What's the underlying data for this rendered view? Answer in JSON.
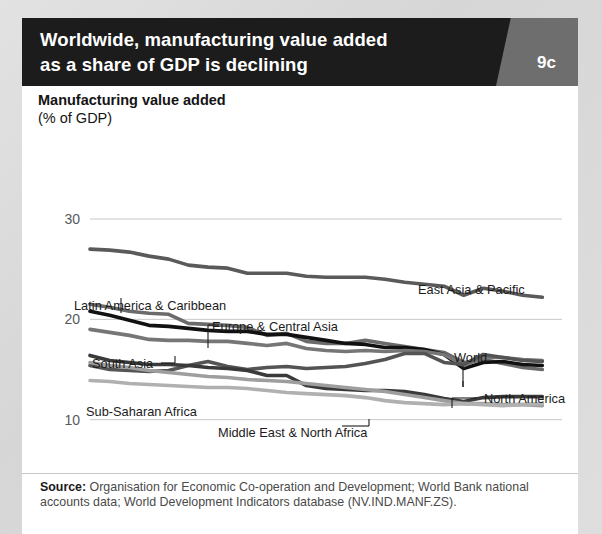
{
  "header": {
    "title": "Worldwide, manufacturing value added as a share of GDP is declining",
    "title_line1": "Worldwide, manufacturing value added",
    "title_line2": "as a share of GDP is declining",
    "badge": "9c",
    "badge_color": "#6e6e6e",
    "bar_color": "#1c1c1c"
  },
  "axis_title": {
    "line1": "Manufacturing value added",
    "line2": "(% of GDP)"
  },
  "source": {
    "label": "Source:",
    "text": " Organisation for Economic Co-operation and Development; World Bank national accounts data; World Development Indicators database (NV.IND.MANF.ZS)."
  },
  "chart_data": {
    "type": "line",
    "title": "Manufacturing value added (% of GDP)",
    "xlabel": "",
    "ylabel": "Manufacturing value added (% of GDP)",
    "xlim": [
      1990,
      2014
    ],
    "ylim": [
      0,
      30
    ],
    "yticks": [
      0,
      10,
      20,
      30
    ],
    "xticks": [
      1990,
      1995,
      2000,
      2005,
      2010,
      2014
    ],
    "grid": "horizontal",
    "legend": "inline-annotations",
    "x": [
      1990,
      1991,
      1992,
      1993,
      1994,
      1995,
      1996,
      1997,
      1998,
      1999,
      2000,
      2001,
      2002,
      2003,
      2004,
      2005,
      2006,
      2007,
      2008,
      2009,
      2010,
      2011,
      2012,
      2013
    ],
    "series": [
      {
        "name": "East Asia & Pacific",
        "color": "#5a5a5a",
        "label_x": 396,
        "label_y": 196,
        "values": [
          27.0,
          26.9,
          26.7,
          26.3,
          26.0,
          25.4,
          25.2,
          25.1,
          24.6,
          24.6,
          24.6,
          24.3,
          24.2,
          24.2,
          24.2,
          24.0,
          23.7,
          23.5,
          23.3,
          22.4,
          23.1,
          22.8,
          22.4,
          22.2
        ]
      },
      {
        "name": "Latin America & Caribbean",
        "color": "#6b6b6b",
        "label_x": 52,
        "label_y": 212,
        "values": [
          21.5,
          21.2,
          20.8,
          20.6,
          20.5,
          19.6,
          19.5,
          19.4,
          19.2,
          18.4,
          18.6,
          17.8,
          17.6,
          17.6,
          17.9,
          17.6,
          17.3,
          17.0,
          16.7,
          15.7,
          16.0,
          15.6,
          15.2,
          15.0
        ]
      },
      {
        "name": "Europe & Central Asia",
        "color": "#111111",
        "label_x": 190,
        "label_y": 233,
        "values": [
          20.8,
          20.4,
          19.9,
          19.4,
          19.3,
          19.1,
          18.9,
          18.8,
          18.8,
          18.5,
          18.5,
          18.2,
          17.9,
          17.6,
          17.5,
          17.2,
          17.2,
          17.0,
          16.5,
          15.1,
          15.7,
          15.8,
          15.5,
          15.4
        ]
      },
      {
        "name": "World",
        "color": "#767676",
        "label_x": 432,
        "label_y": 264,
        "values": [
          19.0,
          18.7,
          18.4,
          18.0,
          17.9,
          17.9,
          17.8,
          17.8,
          17.6,
          17.4,
          17.6,
          17.1,
          16.9,
          16.8,
          16.9,
          16.8,
          16.9,
          16.8,
          16.5,
          15.4,
          16.2,
          16.2,
          16.0,
          15.9
        ]
      },
      {
        "name": "South Asia",
        "color": "#545454",
        "label_x": 70,
        "label_y": 270,
        "values": [
          15.4,
          15.0,
          14.9,
          14.8,
          14.9,
          15.4,
          15.8,
          15.3,
          15.0,
          15.2,
          15.3,
          15.1,
          15.2,
          15.3,
          15.6,
          16.0,
          16.6,
          16.6,
          15.7,
          15.5,
          16.5,
          16.2,
          15.9,
          15.8
        ]
      },
      {
        "name": "North America",
        "color": "#3a3a3a",
        "label_x": 462,
        "label_y": 305,
        "values": [
          16.4,
          15.9,
          15.7,
          15.5,
          15.5,
          15.4,
          15.2,
          15.1,
          14.9,
          14.4,
          14.4,
          13.4,
          13.1,
          13.0,
          12.9,
          12.9,
          12.8,
          12.5,
          12.1,
          11.8,
          12.2,
          12.3,
          12.3,
          12.3
        ]
      },
      {
        "name": "Sub-Saharan Africa",
        "color": "#9e9e9e",
        "label_x": 64,
        "label_y": 318,
        "values": [
          15.7,
          15.4,
          15.2,
          14.9,
          14.7,
          14.5,
          14.3,
          14.2,
          14.0,
          13.9,
          13.8,
          13.6,
          13.4,
          13.2,
          13.0,
          12.8,
          12.5,
          12.2,
          11.9,
          11.6,
          11.6,
          11.5,
          11.5,
          11.4
        ]
      },
      {
        "name": "Middle East & North Africa",
        "color": "#b0b0b0",
        "label_x": 196,
        "label_y": 339,
        "values": [
          13.9,
          13.8,
          13.6,
          13.5,
          13.4,
          13.3,
          13.2,
          13.2,
          13.1,
          12.9,
          12.7,
          12.6,
          12.5,
          12.4,
          12.2,
          11.9,
          11.7,
          11.6,
          11.5,
          11.6,
          11.5,
          11.4,
          11.5,
          11.6
        ]
      }
    ]
  }
}
